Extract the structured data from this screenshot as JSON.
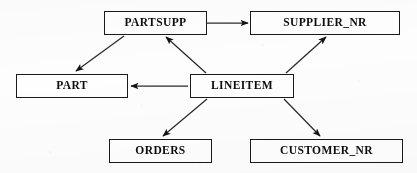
{
  "figure": {
    "kind": "schema-graph",
    "title": "",
    "background_color": "#fdfdfd",
    "line_color": "#1a1a1a",
    "text_color": "#0d0d0d",
    "width": 417,
    "height": 173
  },
  "nodes": [
    {
      "id": "partsupp",
      "label": "PARTSUPP",
      "x": 104,
      "y": 11,
      "w": 103,
      "h": 24
    },
    {
      "id": "supplier_nr",
      "label": "SUPPLIER_NR",
      "x": 250,
      "y": 11,
      "w": 150,
      "h": 24
    },
    {
      "id": "part",
      "label": "PART",
      "x": 16,
      "y": 74,
      "w": 112,
      "h": 24
    },
    {
      "id": "lineitem",
      "label": "LINEITEM",
      "x": 190,
      "y": 74,
      "w": 104,
      "h": 24
    },
    {
      "id": "orders",
      "label": "ORDERS",
      "x": 109,
      "y": 139,
      "w": 103,
      "h": 24
    },
    {
      "id": "customer_nr",
      "label": "CUSTOMER_NR",
      "x": 250,
      "y": 139,
      "w": 153,
      "h": 24
    }
  ],
  "edges": [
    {
      "id": "partsupp-to-supplier_nr",
      "from": "PARTSUPP",
      "to": "SUPPLIER_NR",
      "x1": 207,
      "y1": 23,
      "x2": 248,
      "y2": 23,
      "arrow": "end"
    },
    {
      "id": "partsupp-to-part",
      "from": "PARTSUPP",
      "to": "PART",
      "x1": 124,
      "y1": 36,
      "x2": 76,
      "y2": 71,
      "arrow": "end"
    },
    {
      "id": "lineitem-to-partsupp",
      "from": "LINEITEM",
      "to": "PARTSUPP",
      "x1": 206,
      "y1": 73,
      "x2": 166,
      "y2": 37,
      "arrow": "end"
    },
    {
      "id": "lineitem-to-supplier_nr",
      "from": "LINEITEM",
      "to": "SUPPLIER_NR",
      "x1": 286,
      "y1": 73,
      "x2": 326,
      "y2": 37,
      "arrow": "end"
    },
    {
      "id": "lineitem-to-part",
      "from": "LINEITEM",
      "to": "PART",
      "x1": 188,
      "y1": 86,
      "x2": 131,
      "y2": 86,
      "arrow": "end"
    },
    {
      "id": "lineitem-to-orders",
      "from": "LINEITEM",
      "to": "ORDERS",
      "x1": 207,
      "y1": 99,
      "x2": 163,
      "y2": 136,
      "arrow": "end"
    },
    {
      "id": "lineitem-to-customer_nr",
      "from": "LINEITEM",
      "to": "CUSTOMER_NR",
      "x1": 284,
      "y1": 99,
      "x2": 320,
      "y2": 136,
      "arrow": "end"
    }
  ]
}
